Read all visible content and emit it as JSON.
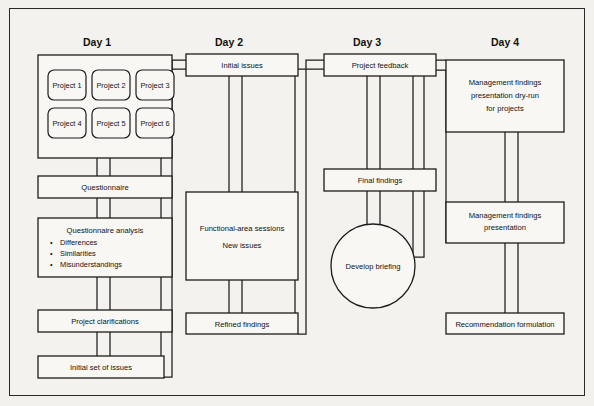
{
  "diagram": {
    "background_color": "#f4f2ee",
    "line_color": "#1d1c1a",
    "columns": [
      {
        "id": "day1",
        "label": "Day 1"
      },
      {
        "id": "day2",
        "label": "Day 2"
      },
      {
        "id": "day3",
        "label": "Day 3"
      },
      {
        "id": "day4",
        "label": "Day 4"
      }
    ],
    "day1": {
      "projects": [
        "Project 1",
        "Project 2",
        "Project 3",
        "Project 4",
        "Project 5",
        "Project 6"
      ],
      "questionnaire": "Questionnaire",
      "analysis_title": "Questionnaire analysis",
      "analysis_bullets": [
        "Differences",
        "Similarities",
        "Misunderstandings"
      ],
      "clarifications": "Project clarifications",
      "initial_set": "Initial set of issues"
    },
    "day2": {
      "initial_issues": "Initial issues",
      "sessions_line1": "Functional-area sessions",
      "sessions_line2": "New issues",
      "refined_findings": "Refined findings"
    },
    "day3": {
      "project_feedback": "Project feedback",
      "final_findings": "Final findings",
      "develop_briefing": "Develop briefing"
    },
    "day4": {
      "dry_run_line1": "Management findings",
      "dry_run_line2": "presentation dry-run",
      "dry_run_line3": "for projects",
      "presentation_line1": "Management findings",
      "presentation_line2": "presentation",
      "recommendation": "Recommendation formulation"
    }
  }
}
